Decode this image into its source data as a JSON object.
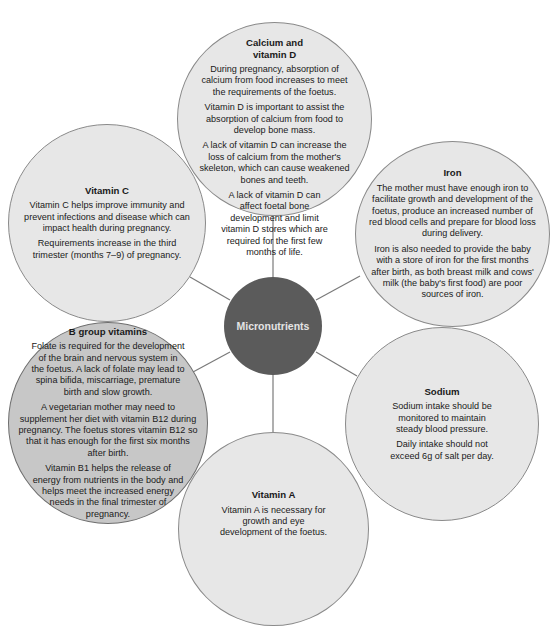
{
  "diagram": {
    "type": "hub-and-spoke",
    "center": {
      "label": "Micronutrients",
      "fill": "#5b5b5b"
    },
    "colors": {
      "light_bubble": "#e7e7e7",
      "highlight_bubble": "#c7c7c7",
      "connector": "#7a7a7a"
    },
    "nodes": [
      {
        "id": "calcium",
        "title_line1": "Calcium and",
        "title_line2": "vitamin D",
        "paragraphs": [
          "During pregnancy, absorption of calcium from food increases to meet the requirements of the foetus.",
          "Vitamin D is important to assist the absorption of calcium from food to develop bone mass.",
          "A lack of vitamin D can increase the loss of calcium from the mother's skeleton, which can cause weakened bones and teeth.",
          "A lack of vitamin D can affect foetal bone development and limit vitamin D stores which are required for the first few months of life."
        ]
      },
      {
        "id": "vitamin-c",
        "title": "Vitamin C",
        "paragraphs": [
          "Vitamin C helps improve immunity and prevent infections and disease which can impact health during pregnancy.",
          "Requirements increase in the third trimester (months 7–9) of pregnancy."
        ]
      },
      {
        "id": "iron",
        "title": "Iron",
        "paragraphs": [
          "The mother must have enough iron to facilitate growth and development of the foetus, produce an increased number of red blood cells and prepare for blood loss during delivery.",
          "Iron is also needed to provide the baby with a store of iron for the first months after birth, as both breast milk and cows' milk (the baby's first food) are poor sources of iron."
        ]
      },
      {
        "id": "b-group",
        "title": "B group vitamins",
        "paragraphs": [
          "Folate is required for the development of the brain and nervous system in the foetus. A lack of folate may lead to spina bifida, miscarriage, premature birth and slow growth.",
          "A vegetarian mother may need to supplement her diet with vitamin B12 during pregnancy. The foetus stores vitamin B12 so that it has enough for the first six months after birth.",
          "Vitamin B1 helps the release of energy from nutrients in the body and helps meet the increased energy needs in the final trimester of pregnancy."
        ]
      },
      {
        "id": "sodium",
        "title": "Sodium",
        "paragraphs": [
          "Sodium intake should be monitored to maintain steady blood pressure.",
          "Daily intake should not exceed 6g of salt per day."
        ]
      },
      {
        "id": "vitamin-a",
        "title": "Vitamin A",
        "paragraphs": [
          "Vitamin A is necessary for growth and eye development of the foetus."
        ]
      }
    ]
  }
}
